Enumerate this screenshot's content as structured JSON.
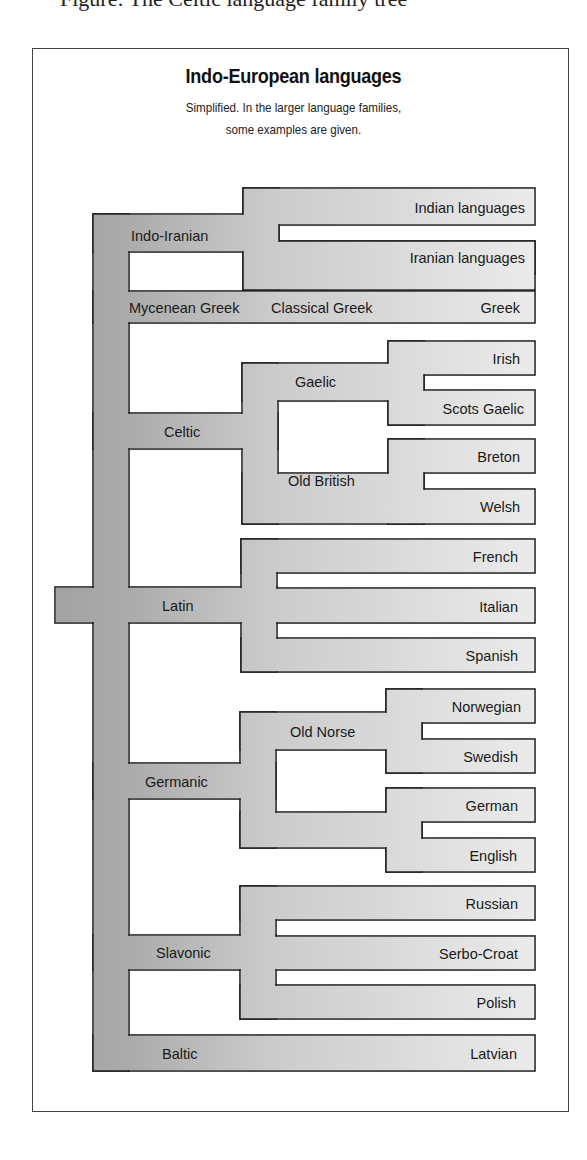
{
  "caption_cutoff": "Figure: The Celtic language family tree",
  "diagram": {
    "title": "Indo-European languages",
    "subtitle_line1": "Simplified. In the larger language families,",
    "subtitle_line2": "some examples are given.",
    "colors": {
      "trunk": "#a8a8a8",
      "branch": "#c8c8c8",
      "leaf": "#e4e4e4",
      "outline": "#222222"
    },
    "root": "Indo-European",
    "branches": [
      {
        "label": "Indo-Iranian",
        "children": [
          "Indian languages",
          "Iranian languages"
        ]
      },
      {
        "label": "Mycenean Greek",
        "intermediate": "Classical Greek",
        "children": [
          "Greek"
        ]
      },
      {
        "label": "Celtic",
        "subgroups": [
          {
            "label": "Gaelic",
            "children": [
              "Irish",
              "Scots Gaelic"
            ]
          },
          {
            "label": "Old British",
            "children": [
              "Breton",
              "Welsh"
            ]
          }
        ]
      },
      {
        "label": "Latin",
        "children": [
          "French",
          "Italian",
          "Spanish"
        ]
      },
      {
        "label": "Germanic",
        "subgroups": [
          {
            "label": "Old Norse",
            "children": [
              "Norwegian",
              "Swedish"
            ]
          },
          {
            "label": "",
            "children": [
              "German",
              "English"
            ]
          }
        ]
      },
      {
        "label": "Slavonic",
        "children": [
          "Russian",
          "Serbo-Croat",
          "Polish"
        ]
      },
      {
        "label": "Baltic",
        "children": [
          "Latvian"
        ]
      }
    ],
    "labels": {
      "indo_iranian": "Indo-Iranian",
      "indian": "Indian languages",
      "iranian": "Iranian languages",
      "mycenean": "Mycenean Greek",
      "classical": "Classical Greek",
      "greek": "Greek",
      "celtic": "Celtic",
      "gaelic": "Gaelic",
      "irish": "Irish",
      "scots": "Scots Gaelic",
      "old_british": "Old British",
      "breton": "Breton",
      "welsh": "Welsh",
      "latin": "Latin",
      "french": "French",
      "italian": "Italian",
      "spanish": "Spanish",
      "germanic": "Germanic",
      "old_norse": "Old Norse",
      "norwegian": "Norwegian",
      "swedish": "Swedish",
      "german": "German",
      "english": "English",
      "slavonic": "Slavonic",
      "russian": "Russian",
      "serbo": "Serbo-Croat",
      "polish": "Polish",
      "baltic": "Baltic",
      "latvian": "Latvian"
    }
  }
}
